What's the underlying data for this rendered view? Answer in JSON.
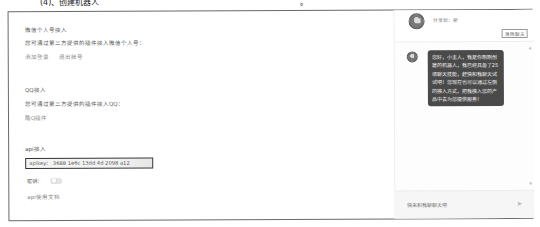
{
  "top_clipped_text": {
    "left": "(4)、创建机器人",
    "right": "。"
  },
  "left_panel": {
    "wechat": {
      "title": "微信个人号接入",
      "description": "您可通过第三方提供的插件接入微信个人号：",
      "links": [
        "添加登录",
        "退出账号"
      ]
    },
    "qq": {
      "title": "QQ接入",
      "description": "您可通过第三方提供的插件接入QQ：",
      "links": [
        "酷Q插件"
      ]
    },
    "api": {
      "title": "api接入",
      "apikey_label": "apikey：",
      "apikey_value": "3688 1e6c 13dd 4d 2098 a12",
      "secret_label": "密钥：",
      "secret_toggle_on": false,
      "doc_link": "api使用文档"
    }
  },
  "chat_panel": {
    "header": {
      "share_text": "分享到：新",
      "clear_button": "清除聊天"
    },
    "messages": [
      {
        "sender": "bot",
        "text": "您好，小主人，我是你刚刚创建的机器人，我已经具备了25项聊天技能，赶快和我聊天试试吧！您现在也可以通过左侧的接入方式，把我接入您的产品中去为您提供服务！"
      }
    ],
    "input": {
      "placeholder": "快来和我聊聊天吧"
    },
    "icons": {
      "send": "send-icon",
      "avatar": "robot-avatar-icon"
    }
  },
  "colors": {
    "border": "#6a6a6a",
    "bubble_bg": "#4a4a4a",
    "bubble_text": "#f1f1f1",
    "muted_text": "#888888",
    "input_bg": "#f6f6f6"
  }
}
